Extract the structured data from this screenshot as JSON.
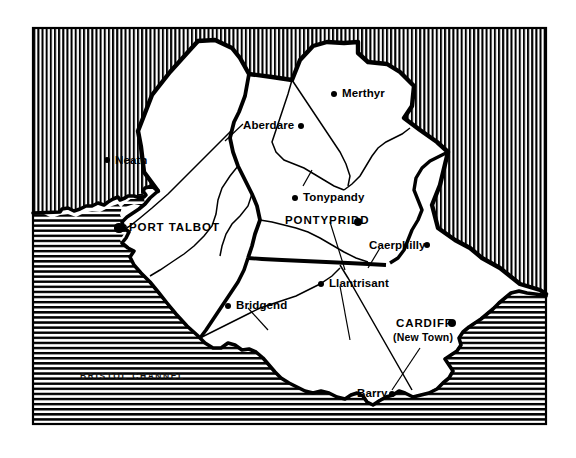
{
  "map": {
    "title": "South Wales county and district map",
    "frame": {
      "x": 33,
      "y": 28,
      "width": 513,
      "height": 396,
      "stroke": "#000000"
    },
    "colors": {
      "ink": "#000000",
      "land": "#ffffff",
      "hatch": "#000000",
      "sea_label": "#111111"
    },
    "hatching": {
      "outside_land": "vertical-lines",
      "sea": "horizontal-lines"
    },
    "sea_labels": [
      {
        "name": "bristol-channel",
        "text": "BRISTOL CHANNEL",
        "x": 80,
        "y": 372
      }
    ],
    "settlements": [
      {
        "name": "neath",
        "label": "Neath",
        "style": "town",
        "text_x": 115,
        "text_y": 155,
        "dot_x": 107,
        "dot_y": 160,
        "dot_r": 3.2,
        "anchor": "left"
      },
      {
        "name": "port-talbot",
        "label": "PORT TALBOT",
        "style": "major",
        "text_x": 129,
        "text_y": 222,
        "dot_x": 119,
        "dot_y": 228,
        "dot_r": 4.6,
        "anchor": "left"
      },
      {
        "name": "aberdare",
        "label": "Aberdare",
        "style": "town",
        "text_x": 243,
        "text_y": 120,
        "dot_x": 301,
        "dot_y": 126,
        "dot_r": 3.2,
        "anchor": "right"
      },
      {
        "name": "merthyr",
        "label": "Merthyr",
        "style": "town",
        "text_x": 342,
        "text_y": 88,
        "dot_x": 334,
        "dot_y": 94,
        "dot_r": 3.2,
        "anchor": "left"
      },
      {
        "name": "tonypandy",
        "label": "Tonypandy",
        "style": "town",
        "text_x": 303,
        "text_y": 192,
        "dot_x": 295,
        "dot_y": 198,
        "dot_r": 3.2,
        "anchor": "left"
      },
      {
        "name": "pontypridd",
        "label": "PONTYPRIDD",
        "style": "major",
        "text_x": 285,
        "text_y": 215,
        "dot_x": 358,
        "dot_y": 222,
        "dot_r": 4.2,
        "anchor": "right"
      },
      {
        "name": "caerphilly",
        "label": "Caerphilly",
        "style": "town",
        "text_x": 369,
        "text_y": 240,
        "dot_x": 427,
        "dot_y": 245,
        "dot_r": 3.2,
        "anchor": "right"
      },
      {
        "name": "llantrisant",
        "label": "Llantrisant",
        "style": "town",
        "text_x": 329,
        "text_y": 278,
        "dot_x": 321,
        "dot_y": 284,
        "dot_r": 3.2,
        "anchor": "left"
      },
      {
        "name": "bridgend",
        "label": "Bridgend",
        "style": "town",
        "text_x": 236,
        "text_y": 300,
        "dot_x": 228,
        "dot_y": 306,
        "dot_r": 3.2,
        "anchor": "left"
      },
      {
        "name": "cardiff",
        "label": "CARDIFF",
        "style": "major",
        "text_x": 396,
        "text_y": 318,
        "dot_x": 452,
        "dot_y": 323,
        "dot_r": 4.2,
        "anchor": "right",
        "sub_label": "(New Town)",
        "sub_x": 393,
        "sub_y": 332
      },
      {
        "name": "barry",
        "label": "Barry",
        "style": "town",
        "text_x": 357,
        "text_y": 388,
        "dot_x": 392,
        "dot_y": 394,
        "dot_r": 3.4,
        "anchor": "right"
      }
    ],
    "leader_lines": [
      {
        "name": "aberdare-leader",
        "from_x": 243,
        "from_y": 124,
        "to_x": 225,
        "to_y": 141
      },
      {
        "name": "tonypandy-leader",
        "from_x": 303,
        "from_y": 186,
        "to_x": 312,
        "to_y": 170
      },
      {
        "name": "pontypridd-leader",
        "from_x": 330,
        "from_y": 222,
        "to_x": 345,
        "to_y": 270
      },
      {
        "name": "caerphilly-leader",
        "from_x": 380,
        "from_y": 248,
        "to_x": 368,
        "to_y": 268
      },
      {
        "name": "llantrisant-leader",
        "from_x": 340,
        "from_y": 286,
        "to_x": 350,
        "to_y": 340
      },
      {
        "name": "bridgend-leader",
        "from_x": 248,
        "from_y": 308,
        "to_x": 268,
        "to_y": 330
      },
      {
        "name": "barry-leader",
        "from_x": 392,
        "from_y": 390,
        "to_x": 420,
        "to_y": 348
      }
    ],
    "boundaries": {
      "county_thick": "thick-black-line",
      "district_thin": "thin-black-line"
    }
  }
}
